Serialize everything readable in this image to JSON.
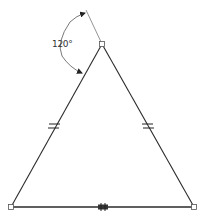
{
  "diagram": {
    "type": "isosceles-triangle-sketch",
    "colors": {
      "line": "#2a2a2a",
      "vertex": "#555555",
      "dimension": "#444444"
    },
    "vertices": {
      "top": [
        102,
        44
      ],
      "left": [
        11,
        207
      ],
      "right": [
        194,
        207
      ]
    },
    "angle_dimension": {
      "label": "120°",
      "value": 120,
      "unit": "degrees"
    },
    "constraints": [
      {
        "type": "equal",
        "edge": "left"
      },
      {
        "type": "equal",
        "edge": "right"
      },
      {
        "type": "midpoint",
        "edge": "base"
      }
    ]
  }
}
